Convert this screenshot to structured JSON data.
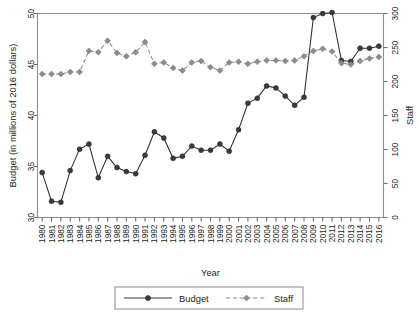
{
  "chart_data": {
    "type": "line",
    "title": "",
    "xlabel": "Year",
    "ylabel": "Budget (in millions of 2016 dollars)",
    "y2label": "Staff",
    "grid": false,
    "legend_position": "bottom",
    "categories": [
      "1980",
      "1981",
      "1982",
      "1983",
      "1984",
      "1985",
      "1986",
      "1987",
      "1988",
      "1989",
      "1990",
      "1991",
      "1992",
      "1993",
      "1994",
      "1995",
      "1996",
      "1997",
      "1998",
      "1999",
      "2000",
      "2001",
      "2002",
      "2003",
      "2004",
      "2005",
      "2006",
      "2007",
      "2008",
      "2009",
      "2010",
      "2011",
      "2012",
      "2013",
      "2014",
      "2015",
      "2016"
    ],
    "xtick_labels": [
      "1980",
      "1981",
      "1982",
      "1983",
      "1984",
      "1985",
      "1986",
      "1987",
      "1988",
      "1989",
      "1990",
      "1991",
      "1992",
      "1993",
      "1994",
      "1995",
      "1996",
      "1997",
      "1998",
      "1999",
      "2000",
      "2001",
      "2002",
      "2003",
      "2004",
      "2005",
      "2006",
      "2007",
      "2008",
      "2009",
      "2010",
      "2011",
      "2012",
      "2013",
      "2014",
      "2015",
      "2016"
    ],
    "ylim": [
      30,
      50
    ],
    "ytick_labels": [
      "30",
      "35",
      "40",
      "45",
      "50"
    ],
    "ytick_values": [
      30,
      35,
      40,
      45,
      50
    ],
    "y2lim": [
      0,
      300
    ],
    "y2tick_labels": [
      "0",
      "50",
      "100",
      "150",
      "200",
      "250",
      "300"
    ],
    "y2tick_values": [
      0,
      50,
      100,
      150,
      200,
      250,
      300
    ],
    "series": [
      {
        "name": "Budget",
        "axis": "left",
        "marker": "circle",
        "linestyle": "solid",
        "color": "#3a3a3a",
        "values": [
          34.4,
          31.6,
          31.5,
          34.6,
          36.7,
          37.2,
          33.9,
          36.0,
          34.9,
          34.5,
          34.3,
          36.1,
          38.4,
          37.8,
          35.8,
          36.0,
          37.0,
          36.6,
          36.6,
          37.2,
          36.5,
          38.6,
          41.2,
          41.7,
          42.9,
          42.7,
          41.9,
          41.0,
          41.8,
          49.6,
          50.0,
          50.1,
          45.4,
          45.3,
          46.6,
          46.6,
          46.8
        ]
      },
      {
        "name": "Staff",
        "axis": "right",
        "marker": "diamond",
        "linestyle": "dashed",
        "color": "#8c8c8c",
        "values": [
          211,
          211,
          211,
          214,
          214,
          245,
          243,
          260,
          242,
          237,
          243,
          258,
          226,
          228,
          220,
          216,
          228,
          230,
          221,
          216,
          228,
          229,
          226,
          229,
          231,
          231,
          230,
          231,
          237,
          245,
          248,
          244,
          227,
          225,
          230,
          234,
          236
        ]
      }
    ]
  },
  "legend": {
    "items": [
      {
        "label": "Budget"
      },
      {
        "label": "Staff"
      }
    ]
  },
  "colors": {
    "budget": "#3a3a3a",
    "staff": "#8c8c8c",
    "axis": "#6f6f6f",
    "text": "#231f20",
    "background": "#ffffff"
  }
}
